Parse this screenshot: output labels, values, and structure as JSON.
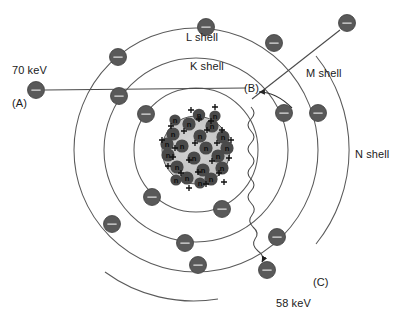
{
  "figure": {
    "type": "atomic-shell-diagram",
    "title_visible": false,
    "background_color": "#ffffff",
    "width": 396,
    "height": 321
  },
  "labels": {
    "incident_energy": "70 keV",
    "marker_a": "(A)",
    "marker_b": "(B)",
    "marker_c": "(C)",
    "emitted_energy": "58 keV",
    "shell_k": "K shell",
    "shell_l": "L shell",
    "shell_m": "M shell",
    "shell_n": "N shell"
  },
  "colors": {
    "electron_fill": "#595959",
    "electron_stroke": "#3d3d3d",
    "shell_stroke": "#5a5a5a",
    "nucleus_fill": "#c9c9c9",
    "neutron_fill": "#4a4a4a",
    "line_stroke": "#4a4a4a",
    "text": "#1a1a1a"
  },
  "label_positions": {
    "incident_energy": {
      "x": 12,
      "y": 64
    },
    "marker_a": {
      "x": 12,
      "y": 97
    },
    "marker_b": {
      "x": 244,
      "y": 83
    },
    "marker_c": {
      "x": 313,
      "y": 276
    },
    "emitted_energy": {
      "x": 276,
      "y": 297
    },
    "shell_k": {
      "x": 190,
      "y": 60
    },
    "shell_l": {
      "x": 186,
      "y": 31
    },
    "shell_m": {
      "x": 306,
      "y": 67
    },
    "shell_n": {
      "x": 355,
      "y": 148
    }
  },
  "atom": {
    "center": {
      "x": 196,
      "y": 150
    },
    "nucleus_radius": 34,
    "shells": [
      {
        "name": "K shell",
        "radius": 62
      },
      {
        "name": "L shell",
        "radius": 92
      },
      {
        "name": "M shell",
        "radius": 122
      },
      {
        "name": "N shell",
        "radius": 150
      }
    ]
  },
  "electrons": [
    {
      "id": "k-upper-left",
      "shell": "K shell",
      "x": 146,
      "y": 114,
      "r": 8.5
    },
    {
      "id": "k-lower-left",
      "shell": "K shell",
      "x": 152,
      "y": 197,
      "r": 8.5
    },
    {
      "id": "k-lower-right",
      "shell": "K shell",
      "x": 222,
      "y": 209,
      "r": 8.5
    },
    {
      "id": "l-top",
      "shell": "L shell",
      "x": 206,
      "y": 27,
      "r": 8.5
    },
    {
      "id": "l-upper-left",
      "shell": "L shell",
      "x": 118,
      "y": 57,
      "r": 8.5
    },
    {
      "id": "l-left",
      "shell": "L shell",
      "x": 119,
      "y": 96,
      "r": 8.5
    },
    {
      "id": "l-lower-left",
      "shell": "L shell",
      "x": 112,
      "y": 224,
      "r": 8.5
    },
    {
      "id": "l-lower",
      "shell": "L shell",
      "x": 185,
      "y": 243,
      "r": 8.5
    },
    {
      "id": "m-upper",
      "shell": "M shell",
      "x": 274,
      "y": 43,
      "r": 8.5
    },
    {
      "id": "m-vacancy-adjacent",
      "shell": "M shell",
      "x": 284,
      "y": 113,
      "r": 8.5
    },
    {
      "id": "m-lower-right",
      "shell": "M shell",
      "x": 277,
      "y": 237,
      "r": 8.5
    },
    {
      "id": "m-bottom",
      "shell": "M shell",
      "x": 198,
      "y": 265,
      "r": 8.5
    },
    {
      "id": "n-right",
      "shell": "N shell",
      "x": 318,
      "y": 113,
      "r": 8.5
    },
    {
      "id": "n-bottom-right",
      "shell": "N shell",
      "x": 267,
      "y": 270,
      "r": 8.5
    },
    {
      "id": "incident-electron-a",
      "shell": "incident",
      "x": 36,
      "y": 90,
      "r": 8.5
    },
    {
      "id": "ejected-electron",
      "shell": "ejected",
      "x": 347,
      "y": 23,
      "r": 8.5
    }
  ],
  "incident_beam": {
    "from": {
      "x": 45,
      "y": 90
    },
    "to": {
      "x": 246,
      "y": 88
    },
    "label": "70 keV"
  },
  "ejected_track": {
    "from": {
      "x": 254,
      "y": 96
    },
    "to": {
      "x": 340,
      "y": 30
    },
    "description": "ejected electron trajectory"
  },
  "transition_arrow": {
    "description": "electron drops from outer shell into K-shell vacancy at (B)",
    "from": {
      "x": 288,
      "y": 105
    },
    "to": {
      "x": 258,
      "y": 92
    }
  },
  "photon": {
    "description": "characteristic x-ray photon emitted",
    "start": {
      "x": 252,
      "y": 108
    },
    "end": {
      "x": 296,
      "y": 283
    },
    "energy": "58 keV",
    "marker": "(C)"
  },
  "nucleus_particles": {
    "proton_symbol": "+",
    "neutron_symbol": "n",
    "proton_count": 24,
    "neutron_count": 22
  }
}
